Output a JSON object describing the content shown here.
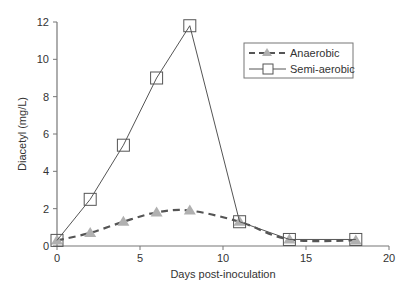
{
  "chart_data": {
    "type": "line",
    "title": "",
    "xlabel": "Days post-inoculation",
    "ylabel": "Diacetyl (mg/L)",
    "xlim": [
      0,
      20
    ],
    "ylim": [
      0,
      12
    ],
    "xticks": [
      0,
      5,
      10,
      15,
      20
    ],
    "yticks": [
      0,
      2,
      4,
      6,
      8,
      10,
      12
    ],
    "grid": false,
    "legend_position": "upper right",
    "series": [
      {
        "name": "Anaerobic",
        "style": "dashed",
        "marker": "triangle",
        "color": "#555555",
        "marker_color": "#b0b0b0",
        "smooth": true,
        "x": [
          0,
          2,
          4,
          6,
          8,
          11,
          14,
          18
        ],
        "values": [
          0.3,
          0.7,
          1.3,
          1.8,
          1.9,
          1.3,
          0.35,
          0.3
        ]
      },
      {
        "name": "Semi-aerobic",
        "style": "solid",
        "marker": "square",
        "color": "#555555",
        "marker_color": "#ffffff",
        "smooth": false,
        "x": [
          0,
          2,
          4,
          6,
          8,
          11,
          14,
          18
        ],
        "values": [
          0.3,
          2.5,
          5.4,
          9.0,
          11.8,
          1.3,
          0.35,
          0.35
        ]
      }
    ]
  }
}
